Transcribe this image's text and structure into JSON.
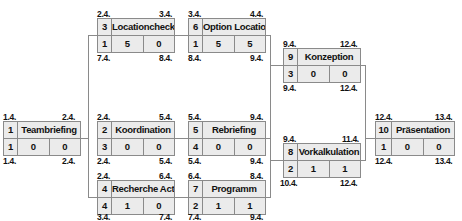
{
  "diagram": {
    "type": "network-plan",
    "nodes": [
      {
        "id": "1",
        "name": "Teambriefing",
        "duration": "1",
        "total_float": "0",
        "free_float": "0",
        "earliest_start": "1.4.",
        "earliest_finish": "2.4.",
        "latest_start": "1.4.",
        "latest_finish": "2.4."
      },
      {
        "id": "2",
        "name": "Koordination",
        "duration": "3",
        "total_float": "0",
        "free_float": "0",
        "earliest_start": "2.4.",
        "earliest_finish": "5.4.",
        "latest_start": "2.4.",
        "latest_finish": "5.4."
      },
      {
        "id": "3",
        "name": "Locationcheck",
        "duration": "1",
        "total_float": "5",
        "free_float": "0",
        "earliest_start": "2.4.",
        "earliest_finish": "3.4.",
        "latest_start": "7.4.",
        "latest_finish": "8.4."
      },
      {
        "id": "4",
        "name": "Recherche Acts",
        "duration": "4",
        "total_float": "1",
        "free_float": "0",
        "earliest_start": "2.4.",
        "earliest_finish": "6.4.",
        "latest_start": "3.4.",
        "latest_finish": "7.4."
      },
      {
        "id": "5",
        "name": "Rebriefing",
        "duration": "4",
        "total_float": "0",
        "free_float": "0",
        "earliest_start": "5.4.",
        "earliest_finish": "9.4.",
        "latest_start": "5.4.",
        "latest_finish": "9.4."
      },
      {
        "id": "6",
        "name": "Option Location",
        "duration": "1",
        "total_float": "5",
        "free_float": "5",
        "earliest_start": "3.4.",
        "earliest_finish": "4.4.",
        "latest_start": "8.4.",
        "latest_finish": "9.4."
      },
      {
        "id": "7",
        "name": "Programm",
        "duration": "2",
        "total_float": "1",
        "free_float": "1",
        "earliest_start": "6.4.",
        "earliest_finish": "8.4.",
        "latest_start": "7.4.",
        "latest_finish": "9.4."
      },
      {
        "id": "8",
        "name": "Vorkalkulation",
        "duration": "2",
        "total_float": "1",
        "free_float": "1",
        "earliest_start": "9.4.",
        "earliest_finish": "11.4.",
        "latest_start": "10.4.",
        "latest_finish": "12.4."
      },
      {
        "id": "9",
        "name": "Konzeption",
        "duration": "3",
        "total_float": "0",
        "free_float": "0",
        "earliest_start": "9.4.",
        "earliest_finish": "12.4.",
        "latest_start": "9.4.",
        "latest_finish": "12.4."
      },
      {
        "id": "10",
        "name": "Präsentation",
        "duration": "1",
        "total_float": "0",
        "free_float": "0",
        "earliest_start": "12.4.",
        "earliest_finish": "13.4.",
        "latest_start": "12.4.",
        "latest_finish": "13.4."
      }
    ],
    "edges": [
      [
        "1",
        "2"
      ],
      [
        "1",
        "3"
      ],
      [
        "1",
        "4"
      ],
      [
        "3",
        "6"
      ],
      [
        "2",
        "5"
      ],
      [
        "4",
        "7"
      ],
      [
        "6",
        "9"
      ],
      [
        "5",
        "9"
      ],
      [
        "7",
        "9"
      ],
      [
        "6",
        "8"
      ],
      [
        "5",
        "8"
      ],
      [
        "7",
        "8"
      ],
      [
        "9",
        "10"
      ],
      [
        "8",
        "10"
      ]
    ]
  }
}
